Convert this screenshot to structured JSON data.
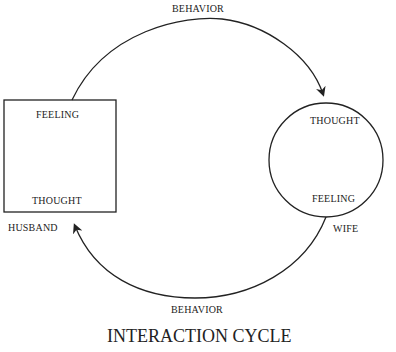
{
  "diagram": {
    "title": "INTERACTION CYCLE",
    "top_arrow_label": "BEHAVIOR",
    "bottom_arrow_label": "BEHAVIOR",
    "husband": {
      "name": "HUSBAND",
      "shape": "square",
      "top_label": "FEELING",
      "bottom_label": "THOUGHT"
    },
    "wife": {
      "name": "WIFE",
      "shape": "circle",
      "top_label": "THOUGHT",
      "bottom_label": "FEELING"
    },
    "colors": {
      "stroke": "#222222",
      "background": "#ffffff"
    }
  }
}
